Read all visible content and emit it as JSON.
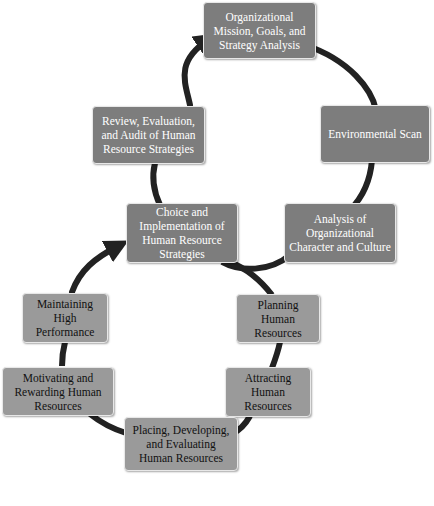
{
  "diagram": {
    "colors": {
      "upper_box_fill": "#7d7d7d",
      "upper_box_text": "#ffffff",
      "lower_box_fill": "#9a9a9a",
      "lower_box_text": "#111111",
      "arrow": "#222222"
    },
    "upper_cycle": {
      "nodes": [
        {
          "id": "mission",
          "label": "Organizational Mission, Goals, and Strategy Analysis"
        },
        {
          "id": "environment",
          "label": "Environmental Scan"
        },
        {
          "id": "analysis",
          "label": "Analysis of Organizational Character and Culture"
        },
        {
          "id": "choice",
          "label": "Choice and Implementation of Human Resource Strategies"
        },
        {
          "id": "review",
          "label": "Review, Evaluation, and Audit of Human Resource Strategies"
        }
      ]
    },
    "lower_cycle": {
      "nodes": [
        {
          "id": "planning",
          "label": "Planning Human Resources"
        },
        {
          "id": "attracting",
          "label": "Attracting Human Resources"
        },
        {
          "id": "placing",
          "label": "Placing, Developing, and Evaluating Human Resources"
        },
        {
          "id": "motivating",
          "label": "Motivating and Rewarding Human Resources"
        },
        {
          "id": "maintaining",
          "label": "Maintaining High Performance"
        }
      ]
    },
    "edges": [
      {
        "from": "review",
        "to": "mission",
        "arrowhead": true
      },
      {
        "from": "maintaining",
        "to": "choice",
        "arrowhead": true
      }
    ]
  }
}
